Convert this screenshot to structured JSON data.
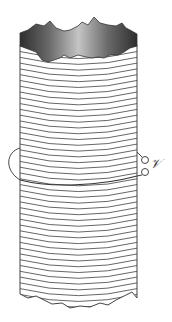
{
  "figure": {
    "label_voltage": "𝒱",
    "colors": {
      "winding": "#555555",
      "cap_dark": "#3a3a3a",
      "cap_light": "#b0b0b0",
      "loop": "#444444",
      "background": "#ffffff"
    },
    "solenoid": {
      "left_x": 20,
      "right_x": 137,
      "top_y": 45,
      "bottom_y": 300,
      "winding_count": 46
    },
    "terminals": [
      {
        "cx": 145,
        "cy": 160,
        "r": 3.5
      },
      {
        "cx": 145,
        "cy": 172,
        "r": 3.5
      }
    ]
  }
}
